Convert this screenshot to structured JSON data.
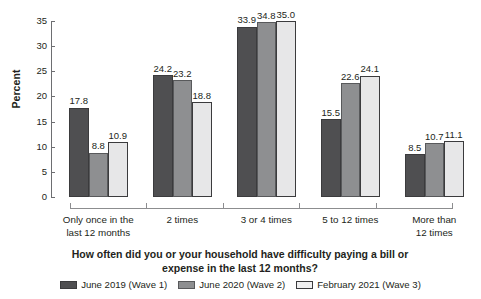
{
  "chart_data": {
    "type": "bar",
    "title": "",
    "subtitle": "",
    "xlabel": "How often did you or your household have difficulty paying a bill or expense in the last 12 months?",
    "xlabel_lines": [
      "How often did you or your household have difficulty paying a bill or",
      "expense in the last 12 months?"
    ],
    "ylabel": "Percent",
    "ylim": [
      0,
      35
    ],
    "ytick_step": 5,
    "yticks": [
      "0",
      "5",
      "10",
      "15",
      "20",
      "25",
      "30",
      "35"
    ],
    "grid": false,
    "legend_position": "bottom",
    "categories": [
      "Only once in the last 12 months",
      "2 times",
      "3 or 4 times",
      "5 to 12 times",
      "More than 12 times"
    ],
    "category_lines": [
      [
        "Only once in the",
        "last 12 months"
      ],
      [
        "2 times"
      ],
      [
        "3 or 4 times"
      ],
      [
        "5 to 12 times"
      ],
      [
        "More than",
        "12 times"
      ]
    ],
    "series": [
      {
        "name": "June 2019 (Wave 1)",
        "color": "#4f4f51",
        "values": [
          17.8,
          24.2,
          33.9,
          15.5,
          8.5
        ],
        "labels": [
          "17.8",
          "24.2",
          "33.9",
          "15.5",
          "8.5"
        ]
      },
      {
        "name": "June 2020 (Wave 2)",
        "color": "#8e8f91",
        "values": [
          8.8,
          23.2,
          34.8,
          22.6,
          10.7
        ],
        "labels": [
          "8.8",
          "23.2",
          "34.8",
          "22.6",
          "10.7"
        ]
      },
      {
        "name": "February 2021 (Wave 3)",
        "color": "#e7e7e8",
        "values": [
          10.9,
          18.8,
          35.0,
          24.1,
          11.1
        ],
        "labels": [
          "10.9",
          "18.8",
          "35.0",
          "24.1",
          "11.1"
        ]
      }
    ]
  }
}
